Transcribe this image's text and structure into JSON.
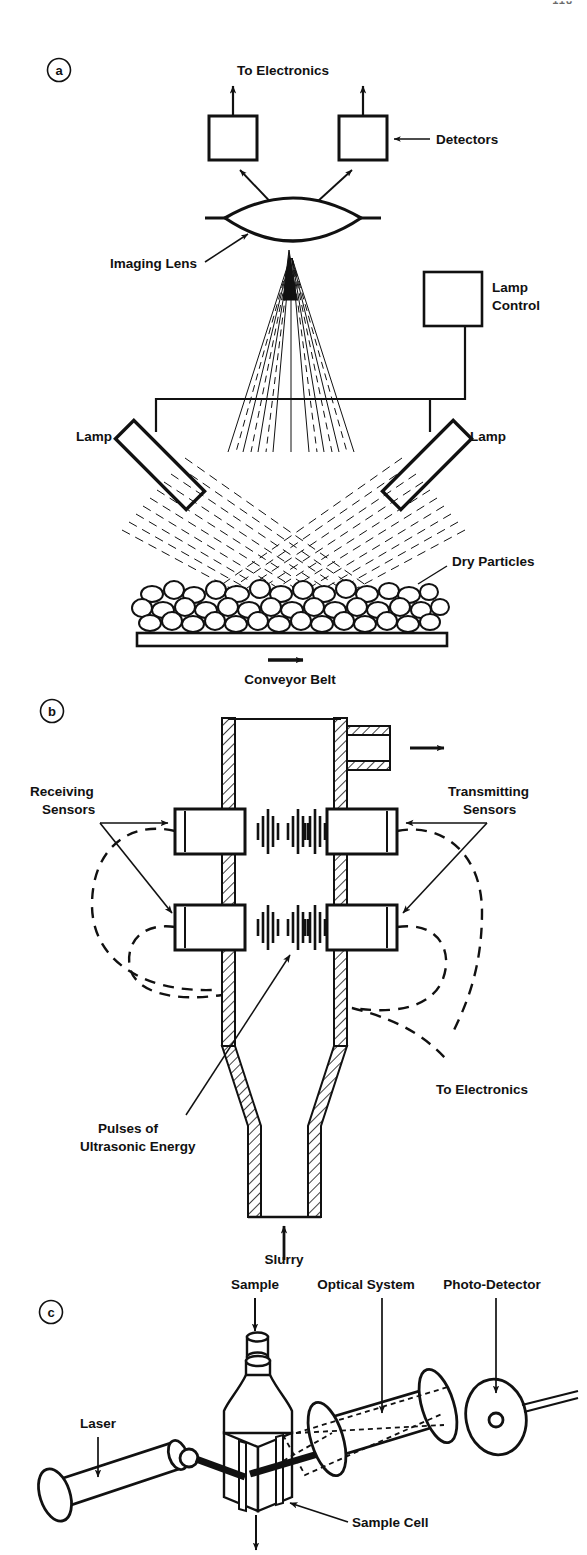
{
  "figure": {
    "corner_mark": "118",
    "background_color": "#ffffff",
    "ink_color": "#111111"
  },
  "panels": [
    {
      "id": "a",
      "id_label": "a",
      "name": "optical-reflectance-conveyor",
      "labels": {
        "to_electronics": "To Electronics",
        "detectors": "Detectors",
        "imaging_lens": "Imaging Lens",
        "lamp_control_line1": "Lamp",
        "lamp_control_line2": "Control",
        "lamp_left": "Lamp",
        "lamp_right": "Lamp",
        "dry_particles": "Dry Particles",
        "conveyor_belt": "Conveyor Belt"
      }
    },
    {
      "id": "b",
      "id_label": "b",
      "name": "ultrasonic-slurry-pipe",
      "labels": {
        "receiving_line1": "Receiving",
        "receiving_line2": "Sensors",
        "transmitting_line1": "Transmitting",
        "transmitting_line2": "Sensors",
        "pulses_line1": "Pulses of",
        "pulses_line2": "Ultrasonic Energy",
        "to_electronics": "To Electronics",
        "slurry": "Slurry"
      }
    },
    {
      "id": "c",
      "id_label": "c",
      "name": "laser-diffraction-sample-cell",
      "labels": {
        "sample": "Sample",
        "optical_system": "Optical System",
        "photo_detector": "Photo-Detector",
        "laser": "Laser",
        "sample_cell": "Sample Cell"
      }
    }
  ]
}
